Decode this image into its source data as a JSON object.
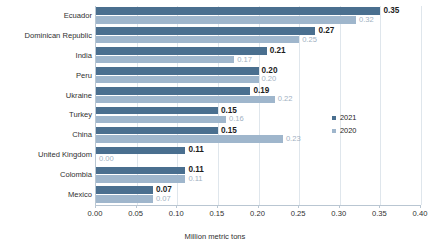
{
  "chart_data": {
    "type": "bar",
    "orientation": "horizontal",
    "title": "",
    "xlabel": "Million metric tons",
    "ylabel": "",
    "xlim": [
      0.0,
      0.4
    ],
    "xticks": [
      "0.00",
      "0.05",
      "0.10",
      "0.15",
      "0.20",
      "0.25",
      "0.30",
      "0.35",
      "0.40"
    ],
    "xtick_values": [
      0.0,
      0.05,
      0.1,
      0.15,
      0.2,
      0.25,
      0.3,
      0.35,
      0.4
    ],
    "grid": "vertical",
    "legend_position": "right-middle",
    "categories": [
      "Ecuador",
      "Dominican Republic",
      "India",
      "Peru",
      "Ukraine",
      "Turkey",
      "China",
      "United Kingdom",
      "Colombia",
      "Mexico"
    ],
    "series": [
      {
        "name": "2021",
        "color": "#4a6f8f",
        "values": [
          0.35,
          0.27,
          0.21,
          0.2,
          0.19,
          0.15,
          0.15,
          0.11,
          0.11,
          0.07
        ],
        "labels": [
          "0.35",
          "0.27",
          "0.21",
          "0.20",
          "0.19",
          "0.15",
          "0.15",
          "0.11",
          "0.11",
          "0.07"
        ]
      },
      {
        "name": "2020",
        "color": "#9fb6cc",
        "values": [
          0.32,
          0.25,
          0.17,
          0.2,
          0.22,
          0.16,
          0.23,
          0.0,
          0.11,
          0.07
        ],
        "labels": [
          "0.32",
          "0.25",
          "0.17",
          "0.20",
          "0.22",
          "0.16",
          "0.23",
          "0.00",
          "0.11",
          "0.07"
        ]
      }
    ]
  },
  "legend": {
    "items": [
      {
        "label": "2021"
      },
      {
        "label": "2020"
      }
    ]
  }
}
